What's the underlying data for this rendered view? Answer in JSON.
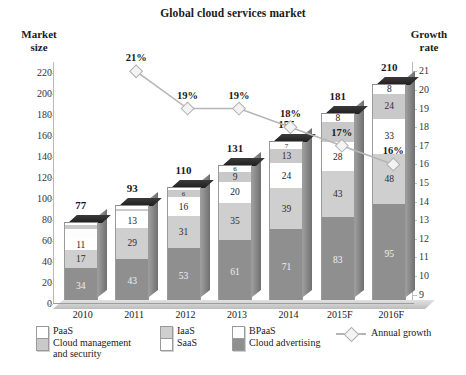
{
  "title": "Global cloud services market",
  "axis_captions": {
    "left": "Market\nsize",
    "right": "Growth\nrate"
  },
  "legend": {
    "items": [
      {
        "key": "paas",
        "label": "PaaS"
      },
      {
        "key": "cms",
        "label": "Cloud management\nand security"
      },
      {
        "key": "iaas",
        "label": "IaaS"
      },
      {
        "key": "saas",
        "label": "SaaS"
      },
      {
        "key": "bpaas",
        "label": "BPaaS"
      },
      {
        "key": "ads",
        "label": "Cloud advertising"
      },
      {
        "key": "growth",
        "label": "Annual growth"
      }
    ]
  },
  "colors": {
    "paas": "#ffffff",
    "cms": "#c9c9c9",
    "iaas": "#cfcfcf",
    "saas": "#ffffff",
    "bpaas": "#fdfdfd",
    "ads": "#8f8f8f",
    "growth_line": "#b5b5b5"
  },
  "chart_data": {
    "type": "bar",
    "title": "Global cloud services market",
    "xlabel": "",
    "ylabel": "Market size",
    "y2label": "Growth rate",
    "ylim": [
      0,
      230
    ],
    "y2lim": [
      8.5,
      21.5
    ],
    "yticks": [
      0,
      20,
      40,
      60,
      80,
      100,
      120,
      140,
      160,
      180,
      200,
      220
    ],
    "y2ticks": [
      9,
      10,
      11,
      12,
      13,
      14,
      15,
      16,
      17,
      18,
      19,
      20,
      21
    ],
    "grid": false,
    "legend_position": "bottom",
    "stacked": true,
    "categories": [
      "2010",
      "2011",
      "2012",
      "2013",
      "2014",
      "2015F",
      "2016F"
    ],
    "totals": [
      77,
      93,
      110,
      131,
      155,
      181,
      210
    ],
    "series": [
      {
        "name": "Cloud advertising",
        "key": "ads",
        "values": [
          34,
          43,
          53,
          61,
          71,
          83,
          95
        ]
      },
      {
        "name": "IaaS",
        "key": "iaas",
        "values": [
          17,
          29,
          31,
          35,
          39,
          43,
          48
        ]
      },
      {
        "name": "SaaS",
        "key": "saas",
        "values": [
          11,
          13,
          16,
          20,
          24,
          28,
          33
        ]
      },
      {
        "name": "BPaaS",
        "key": "bpaas",
        "values": [
          9,
          5,
          6,
          9,
          13,
          19,
          24
        ]
      },
      {
        "name": "Cloud management and security",
        "key": "cms",
        "values": [
          4,
          2,
          2,
          3,
          3,
          4,
          5
        ]
      },
      {
        "name": "PaaS",
        "key": "paas",
        "values": [
          2,
          1,
          2,
          3,
          5,
          4,
          5
        ]
      }
    ],
    "growth": {
      "name": "Annual growth",
      "x": [
        "2011",
        "2012",
        "2013",
        "2014",
        "2015F",
        "2016F"
      ],
      "values": [
        21,
        19,
        19,
        18,
        17,
        16
      ],
      "labels": [
        "21%",
        "19%",
        "19%",
        "18%",
        "17%",
        "16%"
      ]
    }
  },
  "bars": [
    {
      "year": "2010",
      "total": "77",
      "segments": [
        {
          "key": "paas",
          "label": "",
          "value": 2
        },
        {
          "key": "cms",
          "label": "",
          "value": 4
        },
        {
          "key": "bpaas",
          "label": "",
          "value": 9
        },
        {
          "key": "saas",
          "label": "11",
          "value": 11
        },
        {
          "key": "iaas",
          "label": "17",
          "value": 17
        },
        {
          "key": "ads",
          "label": "34",
          "value": 34
        }
      ]
    },
    {
      "year": "2011",
      "total": "93",
      "segments": [
        {
          "key": "paas",
          "label": "",
          "value": 3
        },
        {
          "key": "cms",
          "label": "",
          "value": 2
        },
        {
          "key": "bpaas",
          "label": "",
          "value": 3
        },
        {
          "key": "saas",
          "label": "13",
          "value": 13
        },
        {
          "key": "iaas",
          "label": "29",
          "value": 29
        },
        {
          "key": "ads",
          "label": "43",
          "value": 43
        }
      ]
    },
    {
      "year": "2012",
      "total": "110",
      "segments": [
        {
          "key": "paas",
          "label": "",
          "value": 2
        },
        {
          "key": "cms",
          "label": "6",
          "value": 6
        },
        {
          "key": "bpaas",
          "label": "",
          "value": 2
        },
        {
          "key": "saas",
          "label": "16",
          "value": 16
        },
        {
          "key": "iaas",
          "label": "31",
          "value": 31
        },
        {
          "key": "ads",
          "label": "53",
          "value": 53
        }
      ]
    },
    {
      "year": "2013",
      "total": "131",
      "segments": [
        {
          "key": "paas",
          "label": "6",
          "value": 6
        },
        {
          "key": "cms",
          "label": "9",
          "value": 9
        },
        {
          "key": "saas",
          "label": "20",
          "value": 20
        },
        {
          "key": "iaas",
          "label": "35",
          "value": 35
        },
        {
          "key": "ads",
          "label": "61",
          "value": 61
        }
      ]
    },
    {
      "year": "2014",
      "total": "155",
      "segments": [
        {
          "key": "paas",
          "label": "7",
          "value": 7
        },
        {
          "key": "cms",
          "label": "13",
          "value": 13
        },
        {
          "key": "saas",
          "label": "24",
          "value": 24
        },
        {
          "key": "iaas",
          "label": "39",
          "value": 39
        },
        {
          "key": "ads",
          "label": "71",
          "value": 71
        }
      ]
    },
    {
      "year": "2015F",
      "total": "181",
      "segments": [
        {
          "key": "paas",
          "label": "8",
          "value": 8
        },
        {
          "key": "cms",
          "label": "",
          "value": 19
        },
        {
          "key": "saas",
          "label": "28",
          "value": 28
        },
        {
          "key": "iaas",
          "label": "43",
          "value": 43
        },
        {
          "key": "ads",
          "label": "83",
          "value": 83
        }
      ]
    },
    {
      "year": "2016F",
      "total": "210",
      "segments": [
        {
          "key": "paas",
          "label": "8",
          "value": 8
        },
        {
          "key": "cms",
          "label": "24",
          "value": 24
        },
        {
          "key": "saas",
          "label": "33",
          "value": 33
        },
        {
          "key": "iaas",
          "label": "48",
          "value": 48
        },
        {
          "key": "ads",
          "label": "95",
          "value": 95
        }
      ]
    }
  ]
}
